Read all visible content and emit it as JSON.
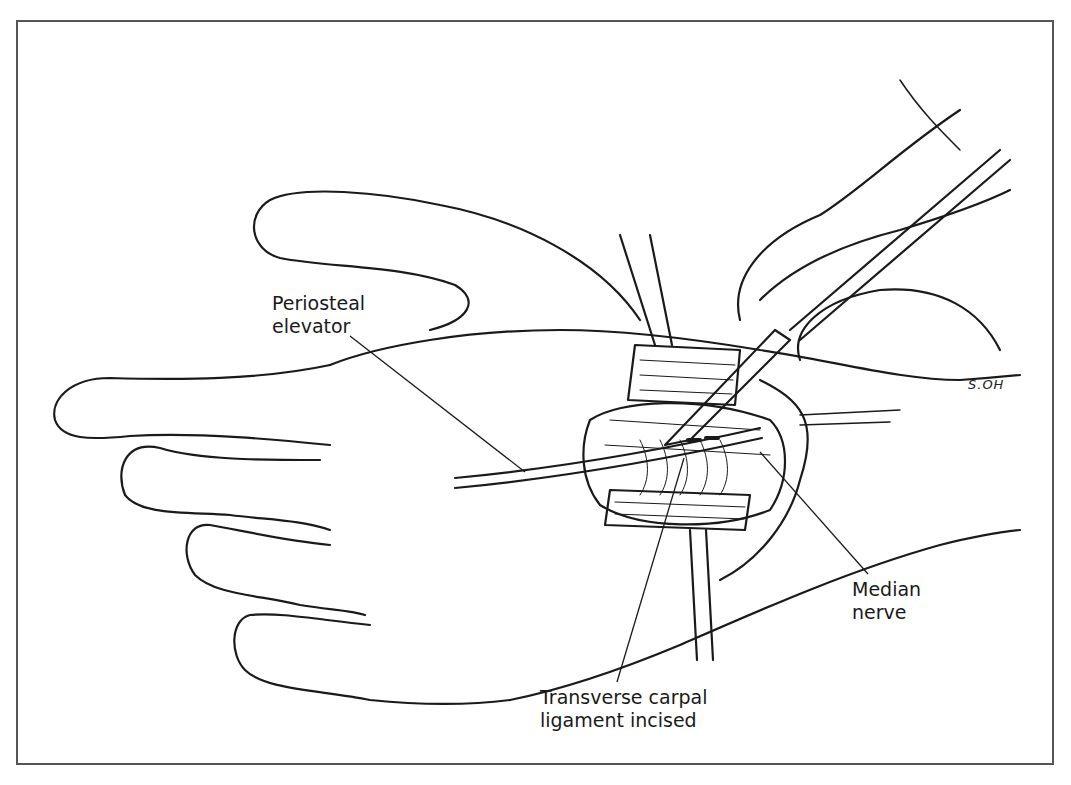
{
  "figure": {
    "labels": {
      "periosteal_elevator": {
        "line1": "Periosteal",
        "line2": "elevator"
      },
      "median_nerve": {
        "line1": "Median",
        "line2": "nerve"
      },
      "transverse_carpal_ligament": {
        "line1": "Transverse carpal",
        "line2": "ligament incised"
      }
    },
    "signature": "S.OH",
    "colors": {
      "ink": "#1a1a1a",
      "frame": "#555555",
      "background": "#ffffff"
    }
  }
}
